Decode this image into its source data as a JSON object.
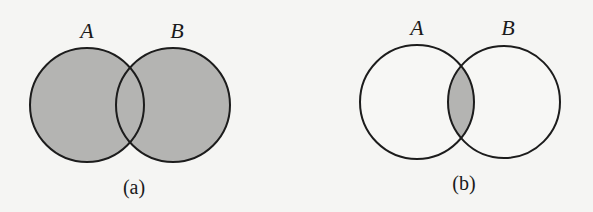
{
  "figure": {
    "colors": {
      "background": "#f5f5f3",
      "shade": "#b4b4b2",
      "stroke": "#1c1c1c",
      "unshaded": "#f7f7f5"
    },
    "panels": [
      {
        "id": "a",
        "caption": "(a)",
        "shaded_region": "union",
        "sets": [
          {
            "label": "A",
            "cx": 87,
            "cy": 105,
            "r": 57,
            "label_x": 87,
            "label_y": 38
          },
          {
            "label": "B",
            "cx": 173,
            "cy": 105,
            "r": 57,
            "label_x": 177,
            "label_y": 38
          }
        ],
        "caption_x": 134,
        "caption_y": 194
      },
      {
        "id": "b",
        "caption": "(b)",
        "shaded_region": "intersection",
        "sets": [
          {
            "label": "A",
            "cx": 417,
            "cy": 102,
            "r": 57,
            "label_x": 417,
            "label_y": 35
          },
          {
            "label": "B",
            "cx": 504,
            "cy": 102,
            "r": 56,
            "label_x": 508,
            "label_y": 35
          }
        ],
        "caption_x": 464,
        "caption_y": 190
      }
    ]
  }
}
